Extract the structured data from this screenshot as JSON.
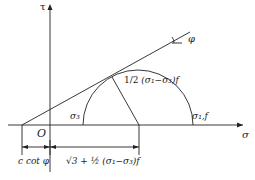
{
  "diagram": {
    "axes": {
      "y_label": "τ",
      "x_label": "σ",
      "origin": "O"
    },
    "angle_label": "φ",
    "circle_labels": {
      "left": "σ₃",
      "right": "σ₁,f"
    },
    "radius_label": {
      "frac": "1/2",
      "expr": "(σ₁−σ₃)f"
    },
    "dims": {
      "left": "c cot φ",
      "right": "√3 + ½ (σ₁−σ₃)f"
    },
    "colors": {
      "line": "#222222",
      "background": "#ffffff"
    }
  }
}
